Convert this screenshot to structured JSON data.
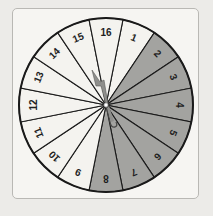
{
  "spinner": {
    "sector_count": 16,
    "labels": [
      "1",
      "2",
      "3",
      "4",
      "5",
      "6",
      "7",
      "8",
      "9",
      "10",
      "11",
      "12",
      "13",
      "14",
      "15",
      "16"
    ],
    "shaded_sectors": [
      "2",
      "3",
      "4",
      "5",
      "6",
      "7",
      "8"
    ],
    "top_sector": "16",
    "colors": {
      "shaded": "#a3a3a0",
      "unshaded": "#f4f3ef",
      "outline": "#1a1a1a",
      "pointer": "#8f8f8c",
      "card": "#f6f5f2"
    },
    "pointer": {
      "direction": "up-left, near sector 16/15 boundary"
    }
  }
}
